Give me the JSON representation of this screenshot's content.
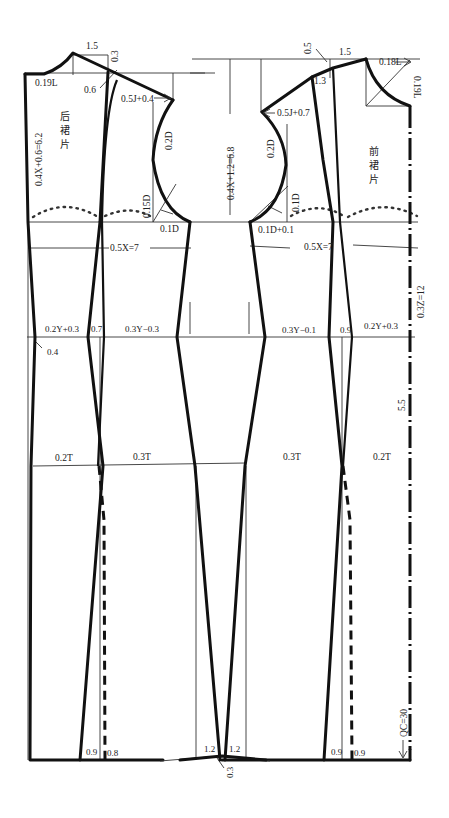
{
  "diagram": {
    "pieces": {
      "back": {
        "name": [
          "后",
          "裙",
          "片"
        ]
      },
      "front": {
        "name": [
          "前",
          "裙",
          "片"
        ]
      }
    },
    "labels": {
      "back_shoulder_1_5": "1.5",
      "back_shoulder_0_3": "0.3",
      "back_neck_0_19L": "0.19L",
      "back_dart_0_6": "0.6",
      "back_shoulder_0_5J": "0.5J+0.4",
      "back_armhole_0_2D": "0.2D",
      "back_length_0_4X": "0.4X+0.6=6.2",
      "back_armhole_0_15D": "0.15D",
      "back_armhole_0_1D": "0.1D",
      "center_0_4X": "0.4X+1.2=6.8",
      "front_shoulder_0_5": "0.5",
      "front_shoulder_1_5": "1.5",
      "front_neck_0_18L": "0.18L",
      "front_neck_0_19L": "0.19L",
      "front_shoulder_1_3": "1.3",
      "front_shoulder_0_5J": "0.5J+0.7",
      "front_armhole_0_2D": "0.2D",
      "front_armhole_0_1D": "0.1D",
      "front_armhole_0_1D_plus": "0.1D+0.1",
      "back_bust_0_5X": "0.5X=7",
      "front_bust_0_5X": "0.5X=7",
      "waist_length_0_3Z": "0.3Z=12",
      "back_waist_0_2Y": "0.2Y+0.3",
      "back_waist_dart_0_7": "0.7",
      "back_waist_0_3Y": "0.3Y−0.3",
      "back_waist_0_4": "0.4",
      "front_waist_0_3Y": "0.3Y−0.1",
      "front_waist_dart_0_9": "0.9",
      "front_waist_0_2Y": "0.2Y+0.3",
      "hip_depth_5_5": "5.5",
      "back_hip_0_2T": "0.2T",
      "back_hip_0_3T": "0.3T",
      "front_hip_0_3T": "0.3T",
      "front_hip_0_2T": "0.2T",
      "hem_back_0_9": "0.9",
      "hem_back_0_8": "0.8",
      "hem_center_1_2_left": "1.2",
      "hem_center_1_2_right": "1.2",
      "hem_center_0_3": "0.3",
      "hem_front_0_9_a": "0.9",
      "hem_front_0_9_b": "0.9",
      "total_length_QC": "QC=30"
    }
  }
}
